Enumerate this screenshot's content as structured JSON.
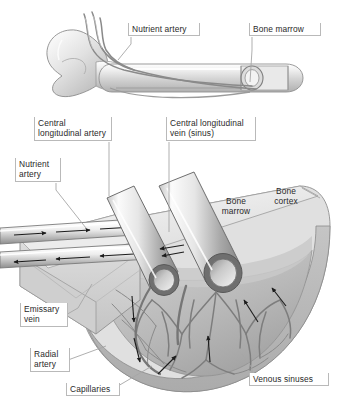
{
  "figure": {
    "background_color": "#ffffff",
    "label_text_color": "#2a2a2a",
    "label_box_border_color": "#b9b9b9",
    "bone_light": "#f2f2f2",
    "bone_mid": "#d6d6d6",
    "bone_dark": "#9a9a9a",
    "vessel_outline": "#6e6e6e",
    "arrow_color": "#1c1c1c"
  },
  "upper_panel": {
    "labels": [
      {
        "name": "nutrient-artery",
        "text": "Nutrient artery",
        "x": 128,
        "y": 23,
        "w": 72,
        "h": 14
      },
      {
        "name": "bone-marrow",
        "text": "Bone marrow",
        "x": 249,
        "y": 23,
        "w": 72,
        "h": 14
      }
    ],
    "leaders": [
      {
        "name": "nutrient-artery-leader",
        "points": "131,37 131,42 119,60"
      },
      {
        "name": "bone-marrow-leader",
        "points": "252,37 252,48 249,84"
      }
    ]
  },
  "lower_panel": {
    "boxed_labels": [
      {
        "name": "central-longitudinal-artery",
        "text": "Central\nlongitudinal artery",
        "x": 34,
        "y": 117,
        "w": 78,
        "h": 25
      },
      {
        "name": "central-longitudinal-vein",
        "text": "Central longitudinal\nvein (sinus)",
        "x": 166,
        "y": 117,
        "w": 90,
        "h": 25
      },
      {
        "name": "nutrient-artery-lower",
        "text": "Nutrient\nartery",
        "x": 15,
        "y": 158,
        "w": 44,
        "h": 25
      },
      {
        "name": "emissary-vein",
        "text": "Emissary\nvein",
        "x": 20,
        "y": 303,
        "w": 47,
        "h": 25
      },
      {
        "name": "radial-artery",
        "text": "Radial\nartery",
        "x": 30,
        "y": 348,
        "w": 39,
        "h": 25
      },
      {
        "name": "capillaries",
        "text": "Capillaries",
        "x": 66,
        "y": 383,
        "w": 53,
        "h": 14
      },
      {
        "name": "venous-sinuses",
        "text": "Venous sinuses",
        "x": 249,
        "y": 373,
        "w": 80,
        "h": 14
      }
    ],
    "plain_labels": [
      {
        "name": "bone-marrow-region",
        "text": "Bone\nmarrow",
        "x": 216,
        "y": 196,
        "w": 40
      },
      {
        "name": "bone-cortex-region",
        "text": "Bone\ncortex",
        "x": 266,
        "y": 186,
        "w": 40
      }
    ],
    "leaders": [
      {
        "name": "central-longitudinal-artery-leader",
        "points": "109,142 109,196"
      },
      {
        "name": "central-longitudinal-vein-leader",
        "points": "169,142 169,232"
      },
      {
        "name": "nutrient-artery-lower-leader",
        "points": "56,183 56,190 86,228"
      },
      {
        "name": "bone-cortex-leader",
        "points": "300,186 318,194"
      },
      {
        "name": "emissary-vein-leader",
        "points": "64,303 64,300 86,276"
      },
      {
        "name": "radial-artery-leader",
        "points": "66,360 104,347"
      },
      {
        "name": "capillaries-leader",
        "points": "116,385 150,366"
      },
      {
        "name": "venous-sinuses-leader",
        "points": "252,373 252,370 243,356"
      }
    ],
    "flow_arrows": {
      "inflow_label": "arterial inflow",
      "outflow_label": "venous outflow",
      "upper_tube_direction": "right",
      "lower_tube_direction": "left"
    }
  }
}
